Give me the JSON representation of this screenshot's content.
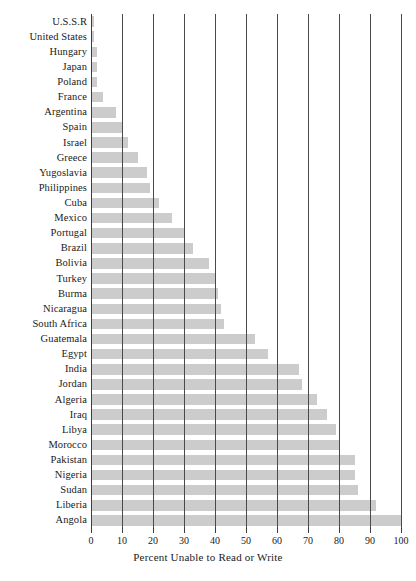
{
  "chart_data": {
    "type": "bar",
    "orientation": "horizontal",
    "title": "",
    "xlabel": "Percent Unable to Read or Write",
    "ylabel": "",
    "xlim": [
      0,
      100
    ],
    "xticks": [
      0,
      10,
      20,
      30,
      40,
      50,
      60,
      70,
      80,
      90,
      100
    ],
    "xticklabels": [
      "0",
      "10",
      "20",
      "30",
      "40",
      "50",
      "60",
      "70",
      "80",
      "90",
      "100"
    ],
    "grid": "vertical",
    "legend": "none",
    "bar_color": "#cccccc",
    "gridline_color": "#4a4a4a",
    "categories": [
      "U.S.S.R",
      "United States",
      "Hungary",
      "Japan",
      "Poland",
      "France",
      "Argentina",
      "Spain",
      "Israel",
      "Greece",
      "Yugoslavia",
      "Philippines",
      "Cuba",
      "Mexico",
      "Portugal",
      "Brazil",
      "Bolivia",
      "Turkey",
      "Burma",
      "Nicaragua",
      "South Africa",
      "Guatemala",
      "Egypt",
      "India",
      "Jordan",
      "Algeria",
      "Iraq",
      "Libya",
      "Morocco",
      "Pakistan",
      "Nigeria",
      "Sudan",
      "Liberia",
      "Angola"
    ],
    "values": [
      1,
      1,
      2,
      2,
      2,
      4,
      8,
      10,
      12,
      15,
      18,
      19,
      22,
      26,
      30,
      33,
      38,
      40,
      41,
      42,
      43,
      53,
      57,
      67,
      68,
      73,
      76,
      79,
      80,
      85,
      85,
      86,
      92,
      100
    ]
  }
}
